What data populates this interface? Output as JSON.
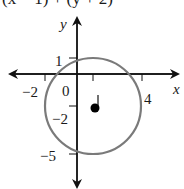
{
  "equation": {
    "text": "(x − 1)² + (y + 2)² = 9",
    "visible_fragment": "(x − 1)  + (y + 2)"
  },
  "axes": {
    "x_label": "x",
    "y_label": "y",
    "x_ticks": [
      {
        "value": -2,
        "label": "−2"
      },
      {
        "value": 0,
        "label": "0"
      },
      {
        "value": 1,
        "label": ""
      },
      {
        "value": 4,
        "label": "4"
      }
    ],
    "y_ticks": [
      {
        "value": 1,
        "label": "1"
      },
      {
        "value": -2,
        "label": "−2"
      },
      {
        "value": -5,
        "label": "−5"
      }
    ]
  },
  "circle": {
    "center": [
      1,
      -2
    ],
    "radius": 3,
    "color": "#7a7a7a"
  },
  "center_point": {
    "x": 1,
    "y": -2,
    "label": "",
    "color": "#000000"
  },
  "labels": {
    "origin": "0",
    "x_neg2": "−2",
    "x_4": "4",
    "y_1": "1",
    "y_neg2": "−2",
    "y_neg5": "−5"
  }
}
